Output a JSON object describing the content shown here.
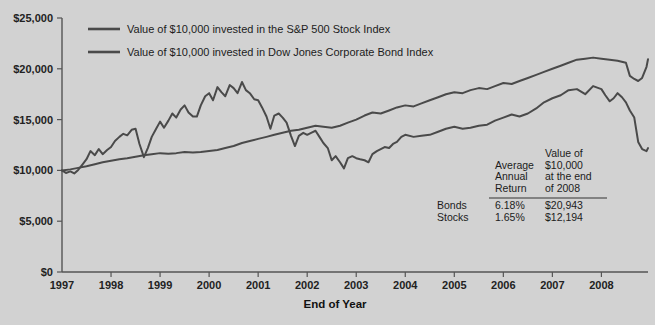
{
  "chart_data": {
    "type": "line",
    "title": "",
    "xlabel": "End of Year",
    "ylabel": "",
    "xlim": [
      1997,
      2008.95
    ],
    "ylim": [
      0,
      25000
    ],
    "grid": false,
    "legend_position": "top-left",
    "ytick_labels": [
      "$0",
      "$5,000",
      "$10,000",
      "$15,000",
      "$20,000",
      "$25,000"
    ],
    "ytick_values": [
      0,
      5000,
      10000,
      15000,
      20000,
      25000
    ],
    "xtick_labels": [
      "1997",
      "1998",
      "1999",
      "2000",
      "2001",
      "2002",
      "2003",
      "2004",
      "2005",
      "2006",
      "2007",
      "2008"
    ],
    "xtick_values": [
      1997,
      1998,
      1999,
      2000,
      2001,
      2002,
      2003,
      2004,
      2005,
      2006,
      2007,
      2008
    ],
    "series": [
      {
        "name": "Value of $10,000 invested in the S&P 500 Stock Index",
        "x": [
          1997.0,
          1997.08,
          1997.17,
          1997.25,
          1997.33,
          1997.42,
          1997.5,
          1997.58,
          1997.67,
          1997.75,
          1997.83,
          1997.92,
          1998.0,
          1998.08,
          1998.17,
          1998.25,
          1998.33,
          1998.42,
          1998.5,
          1998.58,
          1998.67,
          1998.75,
          1998.83,
          1998.92,
          1999.0,
          1999.08,
          1999.17,
          1999.25,
          1999.33,
          1999.42,
          1999.5,
          1999.58,
          1999.67,
          1999.75,
          1999.83,
          1999.92,
          2000.0,
          2000.08,
          2000.17,
          2000.25,
          2000.33,
          2000.42,
          2000.5,
          2000.58,
          2000.67,
          2000.75,
          2000.83,
          2000.92,
          2001.0,
          2001.08,
          2001.17,
          2001.25,
          2001.33,
          2001.42,
          2001.5,
          2001.58,
          2001.67,
          2001.75,
          2001.83,
          2001.92,
          2002.0,
          2002.08,
          2002.17,
          2002.25,
          2002.33,
          2002.42,
          2002.5,
          2002.58,
          2002.67,
          2002.75,
          2002.83,
          2002.92,
          2003.0,
          2003.08,
          2003.17,
          2003.25,
          2003.33,
          2003.42,
          2003.5,
          2003.58,
          2003.67,
          2003.75,
          2003.83,
          2003.92,
          2004.0,
          2004.17,
          2004.33,
          2004.5,
          2004.67,
          2004.83,
          2005.0,
          2005.17,
          2005.33,
          2005.5,
          2005.67,
          2005.83,
          2006.0,
          2006.17,
          2006.33,
          2006.5,
          2006.67,
          2006.83,
          2007.0,
          2007.17,
          2007.33,
          2007.5,
          2007.67,
          2007.83,
          2008.0,
          2008.08,
          2008.17,
          2008.25,
          2008.33,
          2008.42,
          2008.5,
          2008.58,
          2008.67,
          2008.75,
          2008.83,
          2008.92,
          2008.95
        ],
        "values": [
          10000,
          9750,
          9900,
          9700,
          10050,
          10600,
          11100,
          11900,
          11500,
          12100,
          11600,
          12000,
          12300,
          12900,
          13300,
          13600,
          13450,
          14000,
          14100,
          12600,
          11300,
          12200,
          13300,
          14100,
          14800,
          14200,
          14900,
          15600,
          15200,
          16000,
          16400,
          15700,
          15300,
          15300,
          16400,
          17300,
          17600,
          16900,
          18200,
          17700,
          17300,
          18400,
          18100,
          17600,
          18700,
          17900,
          17600,
          17000,
          16900,
          16200,
          15300,
          14100,
          15400,
          15600,
          15200,
          14700,
          13400,
          12400,
          13400,
          13700,
          13500,
          13700,
          13900,
          13300,
          12700,
          12200,
          11000,
          11400,
          10800,
          10200,
          11200,
          11400,
          11200,
          11100,
          11000,
          10800,
          11600,
          11900,
          12100,
          12300,
          12200,
          12600,
          12800,
          13300,
          13500,
          13300,
          13400,
          13500,
          13800,
          14100,
          14300,
          14100,
          14200,
          14400,
          14500,
          14900,
          15200,
          15500,
          15300,
          15600,
          16100,
          16700,
          17100,
          17400,
          17900,
          18000,
          17500,
          18300,
          18000,
          17400,
          16800,
          17100,
          17600,
          17200,
          16700,
          15900,
          15200,
          12800,
          12100,
          11900,
          12194
        ]
      },
      {
        "name": "Value of $10,000 invested in Dow Jones Corporate Bond Index",
        "x": [
          1997.0,
          1997.17,
          1997.33,
          1997.5,
          1997.67,
          1997.83,
          1998.0,
          1998.17,
          1998.33,
          1998.5,
          1998.67,
          1998.83,
          1999.0,
          1999.17,
          1999.33,
          1999.5,
          1999.67,
          1999.83,
          2000.0,
          2000.17,
          2000.33,
          2000.5,
          2000.67,
          2000.83,
          2001.0,
          2001.17,
          2001.33,
          2001.5,
          2001.67,
          2001.83,
          2002.0,
          2002.17,
          2002.33,
          2002.5,
          2002.67,
          2002.83,
          2003.0,
          2003.17,
          2003.33,
          2003.5,
          2003.67,
          2003.83,
          2004.0,
          2004.17,
          2004.33,
          2004.5,
          2004.67,
          2004.83,
          2005.0,
          2005.17,
          2005.33,
          2005.5,
          2005.67,
          2005.83,
          2006.0,
          2006.17,
          2006.33,
          2006.5,
          2006.67,
          2006.83,
          2007.0,
          2007.17,
          2007.33,
          2007.5,
          2007.67,
          2007.83,
          2008.0,
          2008.17,
          2008.33,
          2008.5,
          2008.58,
          2008.67,
          2008.75,
          2008.83,
          2008.92,
          2008.95
        ],
        "values": [
          10000,
          10100,
          10250,
          10400,
          10600,
          10800,
          10950,
          11100,
          11200,
          11350,
          11500,
          11600,
          11700,
          11650,
          11700,
          11800,
          11750,
          11800,
          11900,
          12000,
          12200,
          12400,
          12700,
          12900,
          13100,
          13300,
          13500,
          13700,
          13900,
          14000,
          14200,
          14400,
          14300,
          14200,
          14400,
          14700,
          15000,
          15400,
          15700,
          15600,
          15900,
          16200,
          16400,
          16300,
          16600,
          16900,
          17200,
          17500,
          17700,
          17600,
          17900,
          18100,
          18000,
          18300,
          18600,
          18500,
          18800,
          19100,
          19400,
          19700,
          20000,
          20300,
          20600,
          20900,
          21000,
          21100,
          21000,
          20900,
          20800,
          20600,
          19300,
          19000,
          18800,
          19100,
          20200,
          20943
        ]
      }
    ],
    "annotations": {
      "table": {
        "columns": [
          "",
          "Average\nAnnual\nReturn",
          "Value of\n$10,000\nat the end\nof 2008"
        ],
        "col_header_2_lines": [
          "Average",
          "Annual",
          "Return"
        ],
        "col_header_3_lines": [
          "Value of",
          "$10,000",
          "at the end",
          "of 2008"
        ],
        "rows": [
          {
            "label": "Bonds",
            "return": "6.18%",
            "value": "$20,943"
          },
          {
            "label": "Stocks",
            "return": "1.65%",
            "value": "$12,194"
          }
        ]
      }
    },
    "colors": {
      "background": "#d2d2d2",
      "line": "#4a4a4a",
      "axis": "#555555",
      "text": "#1c1c1c"
    }
  }
}
